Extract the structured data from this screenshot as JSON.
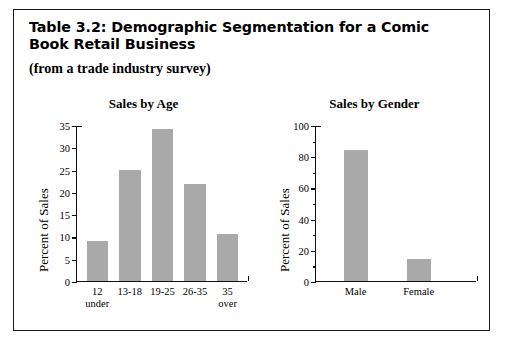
{
  "figure": {
    "caption": "Table 3.2: Demographic Segmentation for a Comic Book Retail Business",
    "subtitle": "(from a trade industry survey)"
  },
  "chart_data": [
    {
      "type": "bar",
      "title": "Sales by Age",
      "xlabel": "",
      "ylabel": "Percent of Sales",
      "categories": [
        "12\nunder",
        "13-18",
        "19-25",
        "26-35",
        "35\nover"
      ],
      "values": [
        9,
        25,
        34,
        21.7,
        10.6
      ],
      "ylim": [
        0,
        35
      ],
      "yticks": [
        0,
        5,
        10,
        15,
        20,
        25,
        30,
        35
      ],
      "ytick_labels": [
        "0",
        "5",
        "10",
        "15",
        "20",
        "25",
        "30",
        "35"
      ],
      "grid": false,
      "legend": "none",
      "bar_color": "#a9a9a9"
    },
    {
      "type": "bar",
      "title": "Sales by Gender",
      "xlabel": "",
      "ylabel": "Percent of Sales",
      "categories": [
        "Male",
        "Female"
      ],
      "values": [
        84,
        14
      ],
      "ylim": [
        0,
        100
      ],
      "yticks": [
        0,
        10,
        20,
        30,
        40,
        50,
        60,
        70,
        80,
        90,
        100
      ],
      "ytick_labels": [
        "0",
        "",
        "20",
        "",
        "40",
        "",
        "60",
        "",
        "80",
        "",
        "100"
      ],
      "grid": false,
      "legend": "none",
      "bar_color": "#a9a9a9"
    }
  ]
}
